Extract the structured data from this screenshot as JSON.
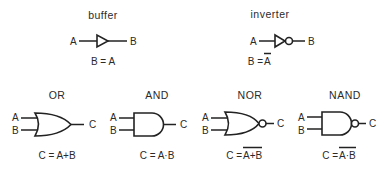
{
  "gates": [
    {
      "id": "buffer",
      "title": "buffer",
      "inputs": [
        "A"
      ],
      "output": "B",
      "equation": "B = A",
      "overbar": ""
    },
    {
      "id": "inverter",
      "title": "inverter",
      "inputs": [
        "A"
      ],
      "output": "B",
      "equation_prefix": "B = ",
      "equation_negated": "A"
    },
    {
      "id": "or",
      "title": "OR",
      "inputs": [
        "A",
        "B"
      ],
      "output": "C",
      "equation": "C = A+B"
    },
    {
      "id": "and",
      "title": "AND",
      "inputs": [
        "A",
        "B"
      ],
      "output": "C",
      "equation": "C = A·B"
    },
    {
      "id": "nor",
      "title": "NOR",
      "inputs": [
        "A",
        "B"
      ],
      "output": "C",
      "equation_prefix": "C = ",
      "equation_negated": "A+B"
    },
    {
      "id": "nand",
      "title": "NAND",
      "inputs": [
        "A",
        "B"
      ],
      "output": "C",
      "equation_prefix": "C = ",
      "equation_negated": "A·B"
    }
  ],
  "colors": {
    "stroke": "#222222",
    "background": "#ffffff"
  }
}
